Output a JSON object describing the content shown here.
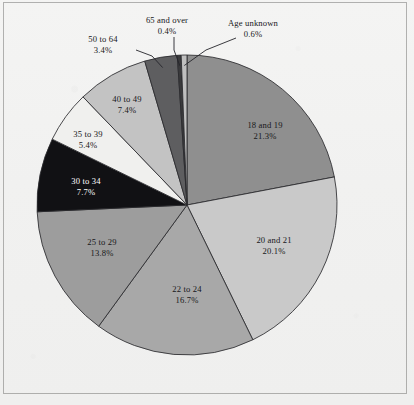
{
  "figure": {
    "background_color": "#f1f1f0",
    "frame_color": "#78786f",
    "outline_color": "#2a2a2e"
  },
  "chart_data": {
    "type": "pie",
    "title": "",
    "subtitle": "",
    "xlabel": "",
    "ylabel": "",
    "legend_position": "none",
    "grid": false,
    "units": "percent",
    "start_angle_deg": 0,
    "direction": "clockwise",
    "categories": [
      "18 and 19",
      "20 and 21",
      "22 to 24",
      "25 to 29",
      "30 to 34",
      "35 to 39",
      "40 to 49",
      "50 to 64",
      "65 and over",
      "Age unknown"
    ],
    "values": [
      21.3,
      20.1,
      16.7,
      13.8,
      7.7,
      5.4,
      7.4,
      3.4,
      0.4,
      0.6
    ],
    "value_labels": [
      "21.3%",
      "20.1%",
      "16.7%",
      "13.8%",
      "7.7%",
      "5.4%",
      "7.4%",
      "3.4%",
      "0.4%",
      "0.6%"
    ],
    "colors": [
      "#8f8f8f",
      "#c9c9c9",
      "#a8a8a8",
      "#9d9d9d",
      "#111114",
      "#f0f0ee",
      "#c3c3c3",
      "#5e5e60",
      "#3a3a3c",
      "#bfbfbf"
    ],
    "label_text_colors": [
      "#17171a",
      "#17171a",
      "#17171a",
      "#17171a",
      "#ffffff",
      "#17171a",
      "#17171a",
      "#17171a",
      "#17171a",
      "#17171a"
    ],
    "slices": [
      {
        "name": "18 and 19",
        "value": 21.3,
        "value_label": "21.3%",
        "color": "#8f8f8f",
        "label_x": 265,
        "label_y": 128,
        "label_placement": "inside",
        "on_dark": false
      },
      {
        "name": "20 and 21",
        "value": 20.1,
        "value_label": "20.1%",
        "color": "#c9c9c9",
        "label_x": 274,
        "label_y": 243,
        "label_placement": "inside",
        "on_dark": false
      },
      {
        "name": "22 to 24",
        "value": 16.7,
        "value_label": "16.7%",
        "color": "#a8a8a8",
        "label_x": 187,
        "label_y": 292,
        "label_placement": "inside",
        "on_dark": false
      },
      {
        "name": "25 to 29",
        "value": 13.8,
        "value_label": "13.8%",
        "color": "#9d9d9d",
        "label_x": 102,
        "label_y": 245,
        "label_placement": "inside",
        "on_dark": false
      },
      {
        "name": "30 to 34",
        "value": 7.7,
        "value_label": "7.7%",
        "color": "#111114",
        "label_x": 86,
        "label_y": 184,
        "label_placement": "inside",
        "on_dark": true
      },
      {
        "name": "35 to 39",
        "value": 5.4,
        "value_label": "5.4%",
        "color": "#f0f0ee",
        "label_x": 88,
        "label_y": 137,
        "label_placement": "inside",
        "on_dark": false
      },
      {
        "name": "40 to 49",
        "value": 7.4,
        "value_label": "7.4%",
        "color": "#c3c3c3",
        "label_x": 127,
        "label_y": 102,
        "label_placement": "inside",
        "on_dark": false
      },
      {
        "name": "50 to 64",
        "value": 3.4,
        "value_label": "3.4%",
        "color": "#5e5e60",
        "label_x": 103,
        "label_y": 42,
        "label_placement": "outside-leader",
        "on_dark": false
      },
      {
        "name": "65 and over",
        "value": 0.4,
        "value_label": "0.4%",
        "color": "#3a3a3c",
        "label_x": 167,
        "label_y": 23,
        "label_placement": "outside-leader",
        "on_dark": false
      },
      {
        "name": "Age unknown",
        "value": 0.6,
        "value_label": "0.6%",
        "color": "#bfbfbf",
        "label_x": 253,
        "label_y": 26,
        "label_placement": "outside-leader",
        "on_dark": false
      }
    ],
    "geometry": {
      "center_x": 187,
      "center_y": 205,
      "radius": 150
    }
  }
}
